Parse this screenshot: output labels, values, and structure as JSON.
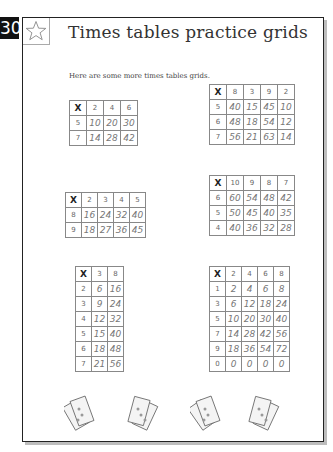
{
  "page_number": "30",
  "title": "Times tables practice grids",
  "intro": "Here are some more times tables grids.",
  "icons": {
    "header": "star-icon",
    "footer": [
      "money-notes-icon",
      "money-notes-icon",
      "money-notes-icon",
      "money-notes-icon"
    ]
  },
  "grids": [
    {
      "corner": "X",
      "columns": [
        "2",
        "4",
        "6"
      ],
      "rows": [
        {
          "label": "5",
          "values": [
            "10",
            "20",
            "30"
          ]
        },
        {
          "label": "7",
          "values": [
            "14",
            "28",
            "42"
          ]
        }
      ]
    },
    {
      "corner": "X",
      "columns": [
        "8",
        "3",
        "9",
        "2"
      ],
      "rows": [
        {
          "label": "5",
          "values": [
            "40",
            "15",
            "45",
            "10"
          ]
        },
        {
          "label": "6",
          "values": [
            "48",
            "18",
            "54",
            "12"
          ]
        },
        {
          "label": "7",
          "values": [
            "56",
            "21",
            "63",
            "14"
          ]
        }
      ]
    },
    {
      "corner": "X",
      "columns": [
        "2",
        "3",
        "4",
        "5"
      ],
      "rows": [
        {
          "label": "8",
          "values": [
            "16",
            "24",
            "32",
            "40"
          ]
        },
        {
          "label": "9",
          "values": [
            "18",
            "27",
            "36",
            "45"
          ]
        }
      ]
    },
    {
      "corner": "X",
      "columns": [
        "10",
        "9",
        "8",
        "7"
      ],
      "rows": [
        {
          "label": "6",
          "values": [
            "60",
            "54",
            "48",
            "42"
          ]
        },
        {
          "label": "5",
          "values": [
            "50",
            "45",
            "40",
            "35"
          ]
        },
        {
          "label": "4",
          "values": [
            "40",
            "36",
            "32",
            "28"
          ]
        }
      ]
    },
    {
      "corner": "X",
      "columns": [
        "3",
        "8"
      ],
      "rows": [
        {
          "label": "2",
          "values": [
            "6",
            "16"
          ]
        },
        {
          "label": "3",
          "values": [
            "9",
            "24"
          ]
        },
        {
          "label": "4",
          "values": [
            "12",
            "32"
          ]
        },
        {
          "label": "5",
          "values": [
            "15",
            "40"
          ]
        },
        {
          "label": "6",
          "values": [
            "18",
            "48"
          ]
        },
        {
          "label": "7",
          "values": [
            "21",
            "56"
          ]
        }
      ]
    },
    {
      "corner": "X",
      "columns": [
        "2",
        "4",
        "6",
        "8"
      ],
      "rows": [
        {
          "label": "1",
          "values": [
            "2",
            "4",
            "6",
            "8"
          ]
        },
        {
          "label": "3",
          "values": [
            "6",
            "12",
            "18",
            "24"
          ]
        },
        {
          "label": "5",
          "values": [
            "10",
            "20",
            "30",
            "40"
          ]
        },
        {
          "label": "7",
          "values": [
            "14",
            "28",
            "42",
            "56"
          ]
        },
        {
          "label": "9",
          "values": [
            "18",
            "36",
            "54",
            "72"
          ]
        },
        {
          "label": "0",
          "values": [
            "0",
            "0",
            "0",
            "0"
          ]
        }
      ]
    }
  ]
}
